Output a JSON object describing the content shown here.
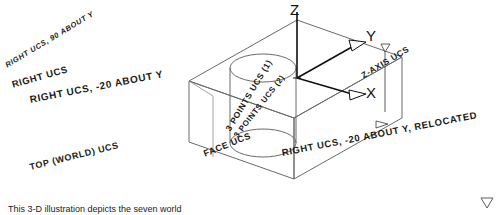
{
  "figure": {
    "ink_color": "#1b1b1b",
    "line_color": "#6a6a6a",
    "axis_color": "#101010",
    "background": "#ffffff"
  },
  "axes": {
    "z_label": "Z",
    "y_label": "Y",
    "x_label": "X"
  },
  "labels": {
    "right_ucs_90_about_y": "RIGHT UCS, 90 ABOUT Y",
    "right_ucs": "RIGHT UCS",
    "right_ucs_minus20_about_y": "RIGHT UCS, -20 ABOUT Y",
    "top_world_ucs": "TOP (WORLD) UCS",
    "z_axis_ucs": "Z-AXIS UCS",
    "three_points_ucs_1": "3 POINTS UCS (1)",
    "three_points_ucs_2": "3 POINTS UCS (2)",
    "face_ucs": "FACE UCS",
    "right_ucs_relocated": "RIGHT UCS, -20 ABOUT Y, RELOCATED"
  },
  "caption": {
    "text": "This 3-D illustration depicts the seven world"
  }
}
